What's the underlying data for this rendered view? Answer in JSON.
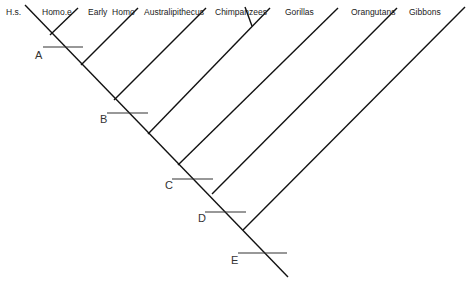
{
  "diagram": {
    "type": "cladogram",
    "taxa": [
      {
        "label": "H.s.",
        "x": 6,
        "y": 8
      },
      {
        "label": "Homo.e",
        "x": 42,
        "y": 8
      },
      {
        "label": "Early  Homo",
        "x": 88,
        "y": 8
      },
      {
        "label": "Australipithecus",
        "x": 144,
        "y": 8
      },
      {
        "label": "Chimpanzees",
        "x": 215,
        "y": 8
      },
      {
        "label": "Gorillas",
        "x": 285,
        "y": 8
      },
      {
        "label": "Orangutans",
        "x": 351,
        "y": 8
      },
      {
        "label": "Gibbons",
        "x": 409,
        "y": 8
      }
    ],
    "nodes": [
      {
        "label": "A",
        "x": 35,
        "y": 50
      },
      {
        "label": "B",
        "x": 100,
        "y": 114
      },
      {
        "label": "C",
        "x": 165,
        "y": 180
      },
      {
        "label": "D",
        "x": 198,
        "y": 213
      },
      {
        "label": "E",
        "x": 231,
        "y": 255
      }
    ],
    "line_color": "#111111"
  }
}
